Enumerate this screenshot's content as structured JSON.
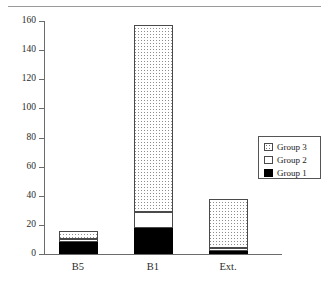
{
  "chart_data": {
    "type": "bar",
    "stacked": true,
    "title": "",
    "subtitle": "",
    "xlabel": "",
    "ylabel": "",
    "categories": [
      "B5",
      "B1",
      "Ext."
    ],
    "series": [
      {
        "name": "Group 1",
        "values": [
          8,
          18,
          2
        ],
        "fill": "solid-black",
        "color": "#000000"
      },
      {
        "name": "Group 2",
        "values": [
          2,
          11,
          2
        ],
        "fill": "white",
        "color": "#ffffff"
      },
      {
        "name": "Group 3",
        "values": [
          6,
          128,
          34
        ],
        "fill": "dotted",
        "color": "#ffffff"
      }
    ],
    "totals": [
      16,
      157,
      38
    ],
    "ylim": [
      0,
      160
    ],
    "ytick_step": 20,
    "yticks": [
      0,
      20,
      40,
      60,
      80,
      100,
      120,
      140,
      160
    ],
    "ytick_labels": [
      "0",
      "20",
      "40",
      "60",
      "80",
      "100",
      "120",
      "140",
      "160"
    ],
    "grid": false,
    "legend_position": "right-middle",
    "legend_entries": [
      "Group 3",
      "Group 2",
      "Group 1"
    ]
  },
  "legend": {
    "entries": [
      {
        "label": "Group 3",
        "swatch": "dotted-swatch"
      },
      {
        "label": "Group 2",
        "swatch": "white-swatch"
      },
      {
        "label": "Group 1",
        "swatch": "black-swatch"
      }
    ]
  }
}
